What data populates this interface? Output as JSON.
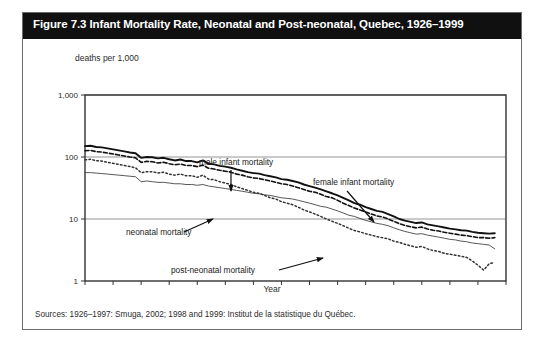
{
  "figure": {
    "title": "Figure 7.3 Infant Mortality Rate, Neonatal and Post-neonatal, Quebec, 1926–1999",
    "source_note": "Sources: 1926–1997: Smuga, 2002; 1998 and 1999: Institut de la statistique du Québec.",
    "unit_label": "deaths per 1,000",
    "title_bar_color": "#101010",
    "frame_color": "#6b6b6b"
  },
  "chart_data": {
    "type": "line",
    "title": "Figure 7.3 Infant Mortality Rate, Neonatal and Post-neonatal, Quebec, 1926–1999",
    "xlabel": "Year",
    "ylabel": "deaths per 1,000",
    "yscale": "log",
    "ylim": [
      1,
      1000
    ],
    "xlim": [
      1926,
      2001
    ],
    "ytick_labels": [
      "1,000",
      "100",
      "10",
      "1"
    ],
    "ytick_values": [
      1000,
      100,
      10,
      1
    ],
    "xtick_labels": [
      "1926",
      "1931",
      "1936",
      "1941",
      "1946",
      "1951",
      "1956",
      "1961",
      "1966",
      "1971",
      "1976",
      "1981",
      "1986",
      "1991",
      "1996",
      "2001"
    ],
    "xtick_values": [
      1926,
      1931,
      1936,
      1941,
      1946,
      1951,
      1956,
      1961,
      1966,
      1971,
      1976,
      1981,
      1986,
      1991,
      1996,
      2001
    ],
    "grid": true,
    "legend": "annotations",
    "annotations": [
      {
        "text": "male infant mortality",
        "target_year": 1951,
        "target_value": 55
      },
      {
        "text": "female infant mortality",
        "target_year": 1978,
        "target_value": 14
      },
      {
        "text": "neonatal mortality",
        "target_year": 1959,
        "target_value": 24
      },
      {
        "text": "post-neonatal mortality",
        "target_year": 1976,
        "target_value": 5.2
      }
    ],
    "x": [
      1926,
      1927,
      1928,
      1929,
      1930,
      1931,
      1932,
      1933,
      1934,
      1935,
      1936,
      1937,
      1938,
      1939,
      1940,
      1941,
      1942,
      1943,
      1944,
      1945,
      1946,
      1947,
      1948,
      1949,
      1950,
      1951,
      1952,
      1953,
      1954,
      1955,
      1956,
      1957,
      1958,
      1959,
      1960,
      1961,
      1962,
      1963,
      1964,
      1965,
      1966,
      1967,
      1968,
      1969,
      1970,
      1971,
      1972,
      1973,
      1974,
      1975,
      1976,
      1977,
      1978,
      1979,
      1980,
      1981,
      1982,
      1983,
      1984,
      1985,
      1986,
      1987,
      1988,
      1989,
      1990,
      1991,
      1992,
      1993,
      1994,
      1995,
      1996,
      1997,
      1998,
      1999
    ],
    "series": [
      {
        "name": "male infant mortality",
        "style": "solid-thick",
        "color": "#111111",
        "values": [
          150,
          152,
          145,
          143,
          138,
          133,
          128,
          123,
          118,
          115,
          97,
          100,
          99,
          95,
          97,
          92,
          88,
          91,
          86,
          86,
          82,
          88,
          78,
          76,
          72,
          70,
          67,
          63,
          60,
          57,
          55,
          54,
          51,
          49,
          47,
          44,
          43,
          41,
          39,
          36,
          34,
          32,
          30,
          28,
          26,
          24,
          22,
          20,
          18,
          17,
          15.5,
          14.5,
          13.5,
          13.0,
          12.0,
          11.0,
          10.0,
          9.4,
          9.0,
          8.6,
          8.8,
          8.2,
          7.9,
          7.6,
          7.3,
          7.0,
          6.8,
          6.6,
          6.5,
          6.2,
          6.0,
          5.9,
          5.8,
          5.9
        ]
      },
      {
        "name": "female infant mortality",
        "style": "dashed",
        "color": "#111111",
        "values": [
          126,
          128,
          122,
          120,
          116,
          112,
          108,
          104,
          100,
          97,
          82,
          85,
          84,
          80,
          82,
          78,
          75,
          77,
          73,
          73,
          70,
          74,
          66,
          64,
          61,
          59,
          57,
          53,
          51,
          48,
          46,
          45,
          43,
          41,
          39,
          37,
          36,
          34,
          32,
          30,
          28,
          27,
          25,
          23,
          22,
          20,
          18,
          16.5,
          15,
          14,
          13,
          12,
          11.2,
          10.8,
          10.0,
          9.2,
          8.4,
          7.9,
          7.5,
          7.2,
          7.4,
          6.9,
          6.6,
          6.4,
          6.1,
          5.9,
          5.7,
          5.5,
          5.4,
          5.2,
          5.0,
          5.0,
          4.9,
          5.0
        ]
      },
      {
        "name": "neonatal mortality",
        "style": "solid-thin",
        "color": "#444444",
        "values": [
          56,
          56,
          55,
          54,
          53,
          52,
          51,
          50,
          49,
          48,
          40,
          41,
          40,
          39,
          39,
          38,
          37,
          37,
          36,
          36,
          35,
          36,
          34,
          33,
          32,
          31,
          30,
          29,
          28,
          27,
          26,
          25.5,
          24.5,
          24,
          23,
          22,
          21.5,
          21,
          20,
          19,
          18,
          17,
          16,
          15.5,
          14.5,
          13.5,
          12.5,
          11.5,
          11,
          10.2,
          9.5,
          9.0,
          8.5,
          8.2,
          7.8,
          7.2,
          6.7,
          6.3,
          6.0,
          5.7,
          5.8,
          5.5,
          5.3,
          5.1,
          4.9,
          4.7,
          4.6,
          4.4,
          4.3,
          4.1,
          4.0,
          3.9,
          3.8,
          3.3
        ]
      },
      {
        "name": "post-neonatal mortality",
        "style": "dotted",
        "color": "#333333",
        "values": [
          90,
          92,
          87,
          86,
          82,
          79,
          76,
          73,
          70,
          67,
          56,
          58,
          58,
          55,
          57,
          53,
          51,
          53,
          50,
          50,
          47,
          51,
          44,
          43,
          40,
          38,
          36,
          33,
          31,
          29,
          27,
          26,
          24,
          22,
          21,
          19,
          18,
          17,
          15.5,
          14.0,
          13.0,
          12.0,
          11.0,
          10.0,
          9.2,
          8.5,
          7.8,
          7.1,
          6.5,
          6.2,
          5.8,
          5.5,
          5.2,
          5.0,
          4.8,
          4.4,
          4.2,
          3.9,
          3.7,
          3.5,
          3.6,
          3.3,
          3.1,
          3.0,
          2.8,
          2.7,
          2.6,
          2.5,
          2.4,
          2.1,
          1.8,
          1.5,
          1.9,
          2.0
        ]
      }
    ]
  }
}
